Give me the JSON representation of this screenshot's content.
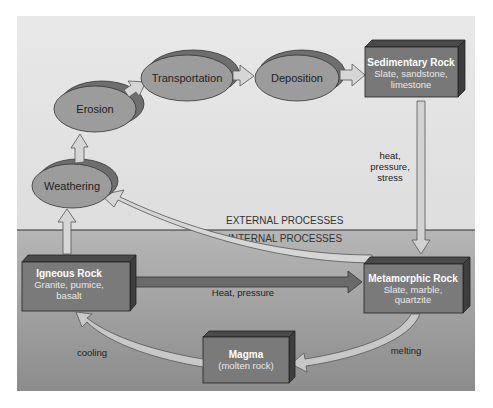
{
  "diagram": {
    "zones": {
      "external": "EXTERNAL PROCESSES",
      "internal": "INTERNAL PROCESSES"
    },
    "processes": [
      {
        "id": "weathering",
        "label": "Weathering"
      },
      {
        "id": "erosion",
        "label": "Erosion"
      },
      {
        "id": "transportation",
        "label": "Transportation"
      },
      {
        "id": "deposition",
        "label": "Deposition"
      }
    ],
    "rocks": {
      "sedimentary": {
        "title": "Sedimentary Rock",
        "line1": "Slate, sandstone,",
        "line2": "limestone"
      },
      "metamorphic": {
        "title": "Metamorphic Rock",
        "line1": "Slate, marble,",
        "line2": "quartzite"
      },
      "igneous": {
        "title": "Igneous Rock",
        "line1": "Granite, pumice,",
        "line2": "basalt"
      },
      "magma": {
        "title": "Magma",
        "line1": "(molten rock)"
      }
    },
    "arrow_labels": {
      "sed_to_meta_1": "heat,",
      "sed_to_meta_2": "pressure,",
      "sed_to_meta_3": "stress",
      "ign_to_meta": "Heat, pressure",
      "meta_to_magma": "melting",
      "magma_to_ign": "cooling"
    },
    "colors": {
      "upper_bg": "#e4e4e4",
      "lower_bg_top": "#b4b4b4",
      "lower_bg_bottom": "#8e8e8e",
      "box_face": "#7a7a7a",
      "box_side": "#4e4e4e",
      "ellipse_face": "#9a9a9a",
      "ellipse_back": "#6e6e6e",
      "arrow_fill": "#d2d2d2",
      "dark_arrow": "#6a6a6a"
    }
  }
}
